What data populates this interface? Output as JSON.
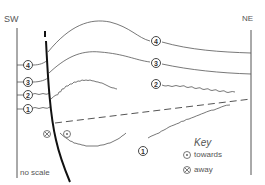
{
  "labels": {
    "sw": "SW",
    "ne": "NE",
    "no_scale": "no scale"
  },
  "key": {
    "title": "Key",
    "items": [
      {
        "symbol": "dot-circle",
        "label": "towards"
      },
      {
        "symbol": "cross-circle",
        "label": "away"
      }
    ]
  },
  "layers": [
    {
      "id": "4",
      "style": "smooth"
    },
    {
      "id": "3",
      "style": "smooth"
    },
    {
      "id": "2",
      "style": "wavy"
    },
    {
      "id": "1",
      "style": "wavy"
    }
  ],
  "fault": {
    "style": "thick-curved",
    "motion_left": "away",
    "motion_right": "towards"
  },
  "dashed_line": {
    "style": "dashed"
  },
  "colors": {
    "line": "#555555",
    "fault": "#111111",
    "text": "#555555"
  }
}
